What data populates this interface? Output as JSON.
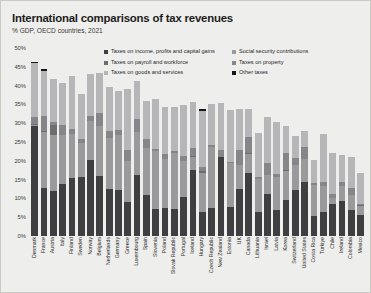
{
  "title": "International comparisons of tax revenues",
  "subtitle": "% GDP, OECD countries, 2021",
  "colors": {
    "income": "#3f3f42",
    "social_security": "#9a9a9d",
    "goods_services": "#b6b6b8",
    "payroll": "#6e6e71",
    "property": "#86868a",
    "other": "#17171a",
    "background": "#eeeeec",
    "border": "#c9c9c5",
    "text": "#1d1d1b"
  },
  "legend": {
    "position": "top",
    "entries": [
      {
        "label": "Taxes on income, profits and capital gains",
        "color": "#3f3f42"
      },
      {
        "label": "Social security contributions",
        "color": "#9a9a9d"
      },
      {
        "label": "Taxes on payroll and workforce",
        "color": "#6e6e71"
      },
      {
        "label": "Taxes on property",
        "color": "#86868a"
      },
      {
        "label": "Taxes on goods and services",
        "color": "#b6b6b8"
      },
      {
        "label": "Other taxes",
        "color": "#17171a"
      }
    ]
  },
  "yaxis": {
    "ticks": [
      "50%",
      "45%",
      "40%",
      "35%",
      "30%",
      "25%",
      "20%",
      "15%",
      "10%",
      "5%",
      "0%"
    ],
    "min": 0,
    "max": 50
  },
  "chart_data": {
    "type": "bar",
    "stacked": true,
    "title": "International comparisons of tax revenues",
    "subtitle": "% GDP, OECD countries, 2021",
    "xlabel": "",
    "ylabel": "% GDP",
    "ylim": [
      0,
      50
    ],
    "grid": false,
    "legend_position": "top",
    "categories": [
      "Denmark",
      "France",
      "Austria",
      "Italy",
      "Finland",
      "Sweden",
      "Norway",
      "Belgium",
      "Netherlands",
      "Germany",
      "Greece",
      "Luxembourg",
      "Spain",
      "Slovenia",
      "Poland",
      "Slovak Republic",
      "Portugal",
      "Iceland",
      "Hungary",
      "Czech Republic",
      "New Zealand",
      "Estonia",
      "UK",
      "Canada",
      "Lithuania",
      "Israel",
      "Latvia",
      "Korea",
      "Switzerland",
      "United States",
      "Costa Rica",
      "Türkiye",
      "Chile",
      "Ireland",
      "Colombia",
      "Mexico"
    ],
    "series": [
      {
        "name": "Taxes on income, profits and capital gains",
        "color": "#3f3f42",
        "values": [
          29.3,
          12.7,
          12.1,
          13.8,
          15.3,
          15.6,
          20.1,
          16.0,
          12.4,
          12.3,
          9.0,
          16.3,
          10.9,
          7.2,
          7.4,
          7.2,
          10.5,
          17.6,
          6.3,
          7.4,
          21.1,
          7.6,
          12.4,
          16.8,
          6.3,
          11.1,
          6.9,
          9.6,
          12.2,
          14.4,
          5.4,
          6.3,
          8.6,
          9.4,
          6.8,
          5.6
        ]
      },
      {
        "name": "Social security contributions",
        "color": "#9a9a9d",
        "values": [
          0.1,
          14.9,
          14.8,
          13.1,
          11.8,
          9.2,
          10.4,
          13.3,
          13.7,
          14.7,
          11.0,
          11.3,
          12.5,
          15.3,
          13.0,
          15.0,
          9.4,
          3.3,
          10.5,
          16.2,
          0.0,
          11.9,
          6.5,
          4.9,
          9.0,
          5.2,
          8.8,
          7.8,
          6.7,
          6.2,
          8.3,
          6.9,
          1.4,
          3.8,
          4.0,
          2.3
        ]
      },
      {
        "name": "Taxes on payroll and workforce",
        "color": "#6e6e71",
        "values": [
          0.3,
          0.4,
          2.7,
          0.0,
          0.0,
          0.0,
          0.0,
          0.0,
          0.0,
          0.0,
          0.0,
          0.0,
          0.0,
          0.1,
          0.0,
          0.0,
          0.0,
          0.3,
          0.4,
          0.0,
          0.0,
          0.0,
          0.1,
          0.5,
          0.0,
          0.0,
          0.0,
          0.1,
          0.0,
          0.0,
          0.0,
          0.0,
          0.0,
          0.2,
          0.0,
          0.3
        ]
      },
      {
        "name": "Taxes on property",
        "color": "#86868a",
        "values": [
          2.0,
          3.8,
          0.6,
          2.6,
          1.4,
          0.9,
          1.3,
          3.4,
          1.9,
          1.2,
          3.0,
          3.5,
          2.5,
          0.6,
          1.4,
          0.5,
          1.4,
          2.1,
          1.1,
          0.5,
          1.9,
          0.3,
          3.9,
          4.2,
          0.3,
          3.2,
          0.9,
          4.5,
          1.9,
          3.0,
          0.4,
          1.3,
          1.1,
          1.0,
          2.1,
          0.3
        ]
      },
      {
        "name": "Taxes on goods and services",
        "color": "#b6b6b8",
        "values": [
          14.4,
          12.0,
          11.6,
          11.1,
          14.1,
          12.1,
          11.3,
          10.7,
          11.6,
          10.3,
          16.1,
          10.0,
          10.1,
          13.3,
          12.5,
          11.6,
          13.6,
          12.4,
          15.0,
          11.1,
          12.3,
          13.6,
          10.8,
          7.5,
          11.9,
          12.2,
          13.8,
          7.2,
          5.9,
          4.4,
          6.1,
          12.6,
          10.9,
          7.1,
          8.0,
          8.4
        ]
      },
      {
        "name": "Other taxes",
        "color": "#17171a",
        "values": [
          0.1,
          0.6,
          0.0,
          0.0,
          0.0,
          0.0,
          0.0,
          0.0,
          0.0,
          0.0,
          0.0,
          0.1,
          0.0,
          0.0,
          0.0,
          0.0,
          0.0,
          0.0,
          0.4,
          0.0,
          0.0,
          0.0,
          0.0,
          0.0,
          0.0,
          0.0,
          0.0,
          0.0,
          0.0,
          0.0,
          0.0,
          0.0,
          0.0,
          0.0,
          0.0,
          0.0
        ]
      }
    ],
    "totals": [
      46.2,
      44.4,
      41.8,
      40.6,
      42.6,
      37.8,
      43.1,
      43.4,
      39.6,
      38.5,
      39.1,
      41.2,
      36.0,
      36.5,
      34.3,
      34.3,
      34.9,
      35.7,
      33.7,
      35.2,
      35.3,
      33.4,
      33.7,
      33.9,
      27.5,
      31.7,
      30.4,
      29.2,
      26.7,
      28.0,
      20.2,
      27.1,
      22.0,
      21.5,
      20.9,
      16.9
    ]
  }
}
